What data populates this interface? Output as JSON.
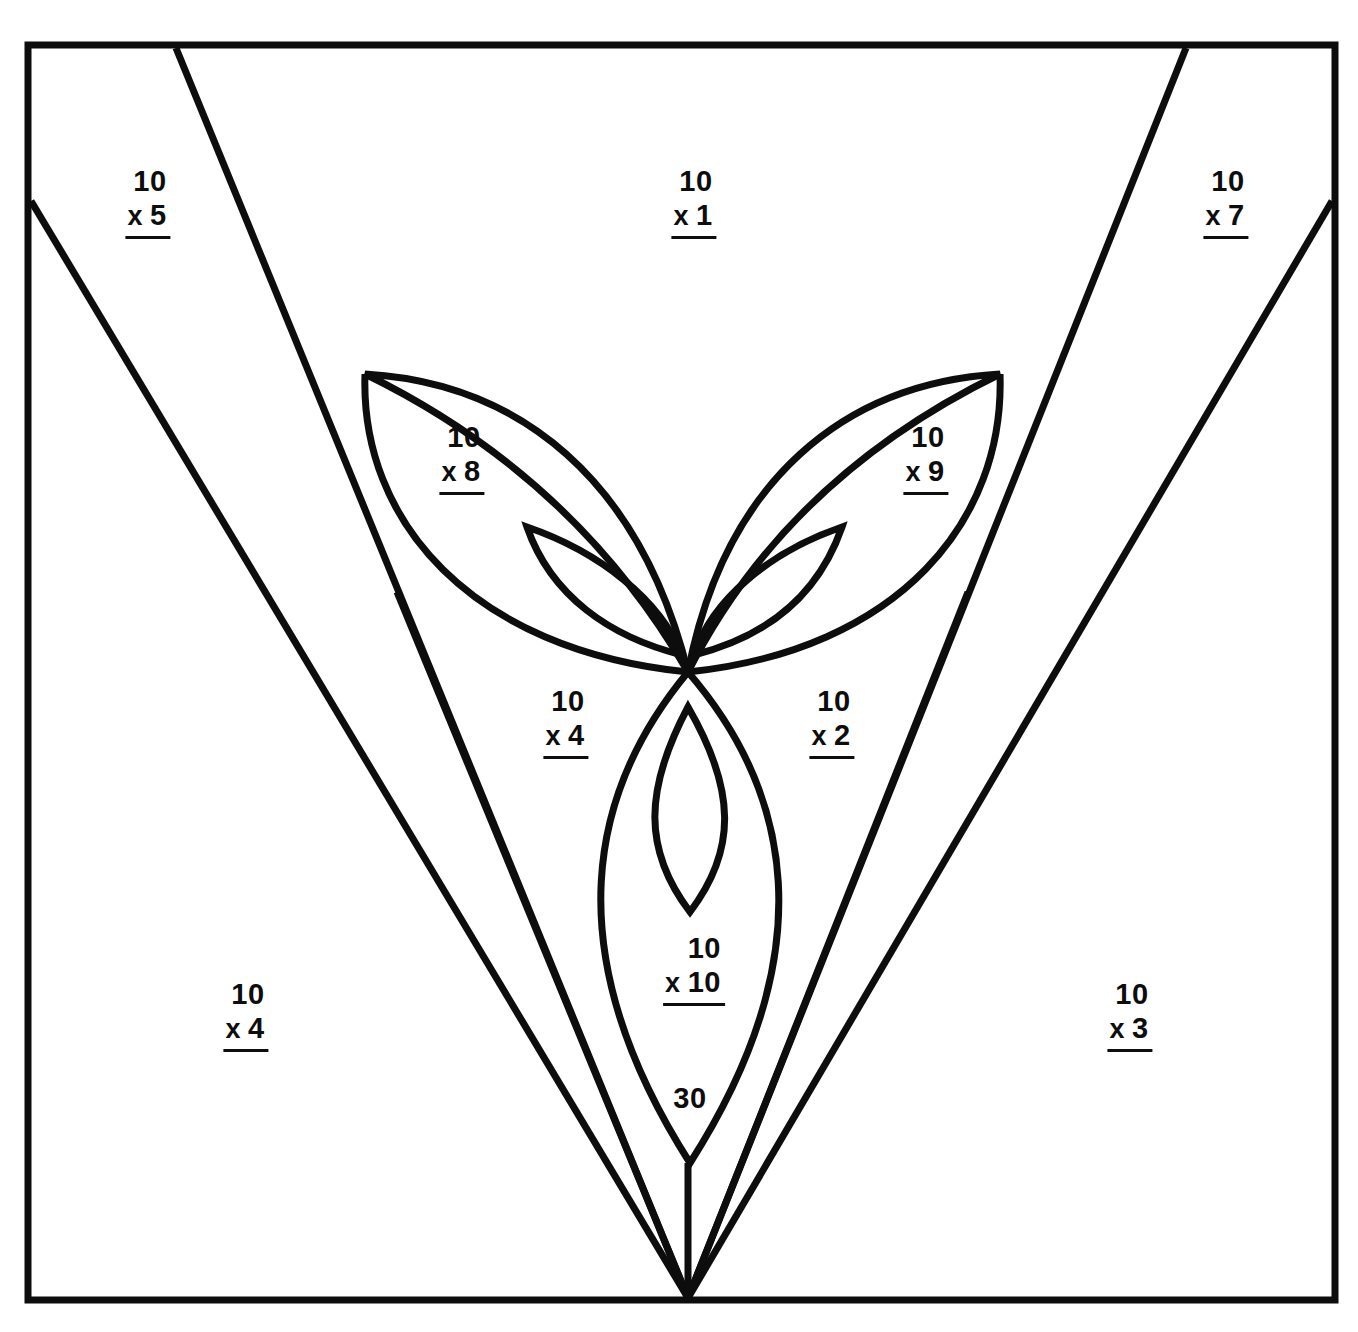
{
  "page": {
    "background_color": "#ffffff",
    "ink_color": "#0d0d0d",
    "width": 1358,
    "height": 1332
  },
  "border": {
    "name": "outer-frame",
    "stroke_width": 7
  },
  "problems": [
    {
      "id": "p-x5",
      "multiplicand": "10",
      "operator": "x",
      "multiplier": "5",
      "x": 148,
      "y": 164,
      "region": "upper-left-outer"
    },
    {
      "id": "p-x1",
      "multiplicand": "10",
      "operator": "x",
      "multiplier": "1",
      "x": 694,
      "y": 164,
      "region": "top-center"
    },
    {
      "id": "p-x7",
      "multiplicand": "10",
      "operator": "x",
      "multiplier": "7",
      "x": 1226,
      "y": 164,
      "region": "upper-right-outer"
    },
    {
      "id": "p-x8",
      "multiplicand": "10",
      "operator": "x",
      "multiplier": "8",
      "x": 462,
      "y": 420,
      "region": "left-large-petal"
    },
    {
      "id": "p-x9",
      "multiplicand": "10",
      "operator": "x",
      "multiplier": "9",
      "x": 926,
      "y": 420,
      "region": "right-large-petal"
    },
    {
      "id": "p-x4b",
      "multiplicand": "10",
      "operator": "x",
      "multiplier": "4",
      "x": 566,
      "y": 684,
      "region": "inner-left-wedge"
    },
    {
      "id": "p-x2",
      "multiplicand": "10",
      "operator": "x",
      "multiplier": "2",
      "x": 832,
      "y": 684,
      "region": "inner-right-wedge"
    },
    {
      "id": "p-x10",
      "multiplicand": "10",
      "operator": "x",
      "multiplier": "10",
      "x": 694,
      "y": 931,
      "region": "bottom-petal"
    },
    {
      "id": "p-x4a",
      "multiplicand": "10",
      "operator": "x",
      "multiplier": "4",
      "x": 246,
      "y": 977,
      "region": "lower-left-outer"
    },
    {
      "id": "p-x3",
      "multiplicand": "10",
      "operator": "x",
      "multiplier": "3",
      "x": 1130,
      "y": 977,
      "region": "lower-right-outer"
    }
  ],
  "plain_numbers": [
    {
      "id": "n-30",
      "value": "30",
      "x": 690,
      "y": 1098,
      "region": "stem-notch"
    }
  ],
  "artwork": {
    "description": "Flower/plant line drawing formed by a large V of straight rays converging at the bottom center, two large upper petals, two small inner petals, and one large lower petal with a small inner lens.",
    "shapes": [
      "outer-frame",
      "ray-left-outer",
      "ray-left-mid",
      "ray-left-inner",
      "ray-right-inner",
      "ray-right-mid",
      "ray-right-outer",
      "stem-line",
      "large-petal-left",
      "large-petal-right",
      "small-petal-left",
      "small-petal-right",
      "bottom-petal",
      "bottom-petal-inner-lens"
    ]
  }
}
